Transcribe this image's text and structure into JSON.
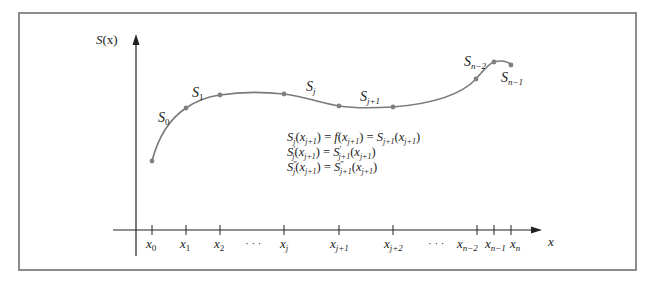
{
  "figure": {
    "colors": {
      "frame": "#8c8c8c",
      "axis": "#222222",
      "curve": "#7a7a7a",
      "knot": "#808080",
      "text": "#1a1a1a"
    },
    "y_axis_label": {
      "base": "S",
      "rest": "(x)"
    },
    "x_axis_label": "x",
    "x_ticks": [
      {
        "base": "x",
        "sub": "0"
      },
      {
        "base": "x",
        "sub": "1"
      },
      {
        "base": "x",
        "sub": "2"
      },
      {
        "base": "x",
        "sub": "j"
      },
      {
        "base": "x",
        "sub": "j+1"
      },
      {
        "base": "x",
        "sub": "j+2"
      },
      {
        "base": "x",
        "sub": "n−2"
      },
      {
        "base": "x",
        "sub": "n−1"
      },
      {
        "base": "x",
        "sub": "n"
      }
    ],
    "ellipsis": "· · ·",
    "segment_labels": [
      {
        "base": "S",
        "sub": "0"
      },
      {
        "base": "S",
        "sub": "1"
      },
      {
        "base": "S",
        "sub": "j"
      },
      {
        "base": "S",
        "sub": "j+1"
      },
      {
        "base": "S",
        "sub": "n−2"
      },
      {
        "base": "S",
        "sub": "n−1"
      }
    ],
    "equations": [
      "S_j(x_{j+1}) = f(x_{j+1}) = S_{j+1}(x_{j+1})",
      "S'_j(x_{j+1}) = S'_{j+1}(x_{j+1})",
      "S''_j(x_{j+1}) = S''_{j+1}(x_{j+1})"
    ],
    "eq_parts": {
      "S": "S",
      "j": "j",
      "jp1": "j+1",
      "x": "x",
      "f": "f",
      "eq": " = ",
      "lp": "(",
      "rp": ")",
      "prime1": "′",
      "prime2": "″"
    }
  }
}
